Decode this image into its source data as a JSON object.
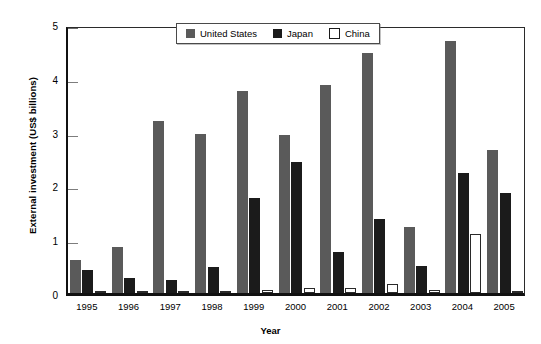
{
  "chart_data": {
    "type": "bar",
    "title": "",
    "xlabel": "Year",
    "ylabel": "External investment (US$ billions)",
    "categories": [
      "1995",
      "1996",
      "1997",
      "1998",
      "1999",
      "2000",
      "2001",
      "2002",
      "2003",
      "2004",
      "2005"
    ],
    "ylim": [
      0,
      5
    ],
    "yticks": [
      0,
      1,
      2,
      3,
      4,
      5
    ],
    "ytick_labels": [
      "0",
      "1",
      "2",
      "3",
      "4",
      "5"
    ],
    "grid": false,
    "legend_position": "top-center",
    "series": [
      {
        "name": "United States",
        "color": "#5a5a5a",
        "values": [
          0.62,
          0.85,
          3.2,
          2.95,
          3.75,
          2.93,
          3.86,
          4.47,
          1.22,
          4.68,
          2.65
        ]
      },
      {
        "name": "Japan",
        "color": "#1b1b1b",
        "values": [
          0.43,
          0.27,
          0.25,
          0.48,
          1.76,
          2.44,
          0.76,
          1.37,
          0.5,
          2.24,
          1.85
        ]
      },
      {
        "name": "China",
        "color": "#ffffff",
        "values": [
          0.02,
          0.02,
          0.02,
          0.02,
          0.05,
          0.09,
          0.1,
          0.17,
          0.05,
          1.1,
          0.04
        ]
      }
    ]
  }
}
